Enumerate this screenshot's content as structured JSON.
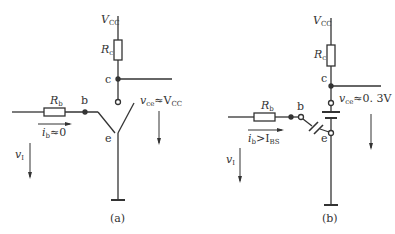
{
  "figure_a": {
    "vcc": "V",
    "vcc_sub": "CC",
    "rc": "R",
    "rc_sub": "c",
    "rb": "R",
    "rb_sub": "b",
    "node_c": "c",
    "node_b": "b",
    "node_e": "e",
    "vce_label": "v",
    "vce_sub": "ce",
    "vce_value": "≈V",
    "vce_value_sub": "CC",
    "ib_label": "i",
    "ib_sub": "b",
    "ib_value": "≈0",
    "vi_label": "v",
    "vi_sub": "I",
    "caption": "(a)"
  },
  "figure_b": {
    "vcc": "V",
    "vcc_sub": "CC",
    "rc": "R",
    "rc_sub": "c",
    "rb": "R",
    "rb_sub": "b",
    "node_c": "c",
    "node_b": "b",
    "node_e": "e",
    "vce_label": "v",
    "vce_sub": "ce",
    "vce_value": "≈0. 3V",
    "ib_label": "i",
    "ib_sub": "b",
    "ib_value": ">I",
    "ib_value_sub": "BS",
    "vi_label": "v",
    "vi_sub": "I",
    "caption": "(b)"
  }
}
